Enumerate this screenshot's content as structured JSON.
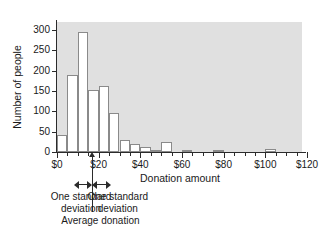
{
  "chart_data": {
    "type": "bar",
    "title": "",
    "xlabel": "Donation amount",
    "ylabel": "Number of people",
    "xlim": [
      0,
      120
    ],
    "ylim": [
      0,
      320
    ],
    "grid": false,
    "legend": null,
    "bin_width": 5,
    "x_tick_labels": [
      "$0",
      "$20",
      "$40",
      "$60",
      "$80",
      "$100",
      "$120"
    ],
    "x_tick_values": [
      0,
      20,
      40,
      60,
      80,
      100,
      120
    ],
    "x_minor_tick_step": 5,
    "y_tick_labels": [
      "0",
      "50",
      "100",
      "150",
      "200",
      "250",
      "300"
    ],
    "y_tick_values": [
      0,
      50,
      100,
      150,
      200,
      250,
      300
    ],
    "bins": [
      {
        "start": 0,
        "end": 5,
        "value": 43
      },
      {
        "start": 5,
        "end": 10,
        "value": 190
      },
      {
        "start": 10,
        "end": 15,
        "value": 295
      },
      {
        "start": 15,
        "end": 20,
        "value": 152
      },
      {
        "start": 20,
        "end": 25,
        "value": 162
      },
      {
        "start": 25,
        "end": 30,
        "value": 97
      },
      {
        "start": 30,
        "end": 35,
        "value": 30
      },
      {
        "start": 35,
        "end": 40,
        "value": 20
      },
      {
        "start": 40,
        "end": 45,
        "value": 12
      },
      {
        "start": 45,
        "end": 50,
        "value": 5
      },
      {
        "start": 50,
        "end": 55,
        "value": 24
      },
      {
        "start": 60,
        "end": 65,
        "value": 5
      },
      {
        "start": 75,
        "end": 80,
        "value": 5
      },
      {
        "start": 100,
        "end": 105,
        "value": 8
      }
    ],
    "categories": [
      "$0-5",
      "$5-10",
      "$10-15",
      "$15-20",
      "$20-25",
      "$25-30",
      "$30-35",
      "$35-40",
      "$40-45",
      "$45-50",
      "$50-55",
      "$60-65",
      "$75-80",
      "$100-105"
    ],
    "values": [
      43,
      190,
      295,
      152,
      162,
      97,
      30,
      20,
      12,
      5,
      24,
      5,
      5,
      8
    ],
    "annotations": {
      "mean_value": 17,
      "sd_low": 8,
      "sd_high": 26,
      "left_label_line1": "One standard",
      "left_label_line2": "deviation",
      "right_label_line1": "One standard",
      "right_label_line2": "deviation",
      "mean_label": "Average donation"
    },
    "colors": {
      "plot_background": "#e0e0e0",
      "bar_fill": "#ffffff",
      "bar_stroke": "#8a8a8a",
      "axis": "#2b2b2b",
      "text": "#1a1a1a",
      "page_background": "#ffffff"
    }
  }
}
